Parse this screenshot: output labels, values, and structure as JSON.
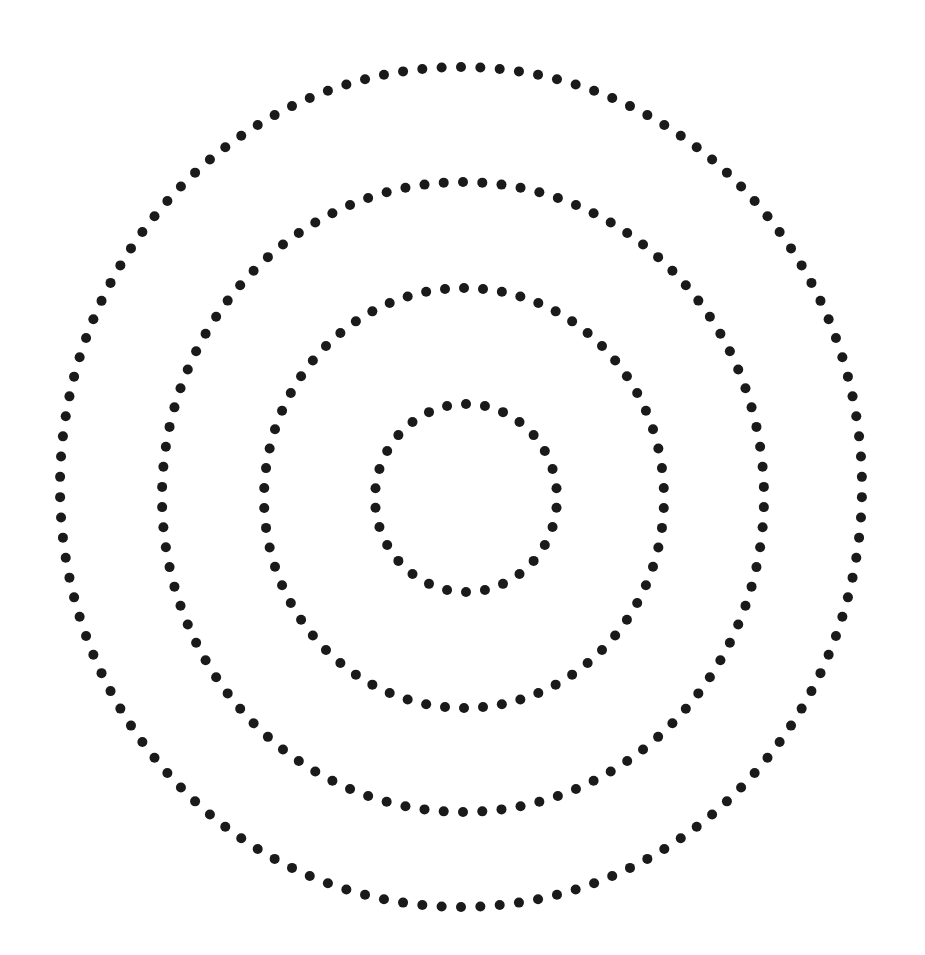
{
  "diagram": {
    "type": "concentric-dotted-rings",
    "background": "#ffffff",
    "dot_color": "#1a1a1a",
    "dot_radius": 5,
    "rings": [
      {
        "name": "ring-inner",
        "cx": 466,
        "cy": 498,
        "rx": 91,
        "ry": 94,
        "dots": 30
      },
      {
        "name": "ring-second",
        "cx": 464,
        "cy": 498,
        "rx": 200,
        "ry": 210,
        "dots": 66
      },
      {
        "name": "ring-third",
        "cx": 463,
        "cy": 497,
        "rx": 301,
        "ry": 315,
        "dots": 98
      },
      {
        "name": "ring-outer",
        "cx": 461,
        "cy": 487,
        "rx": 401,
        "ry": 420,
        "dots": 130
      }
    ]
  }
}
